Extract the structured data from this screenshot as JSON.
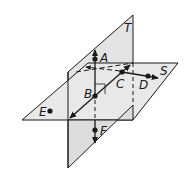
{
  "diagram": {
    "title": "",
    "planes": [
      {
        "name": "T",
        "label": "T",
        "orientation": "vertical"
      },
      {
        "name": "S",
        "label": "S",
        "orientation": "horizontal"
      }
    ],
    "points": [
      {
        "name": "A",
        "label": "A"
      },
      {
        "name": "B",
        "label": "B"
      },
      {
        "name": "C",
        "label": "C"
      },
      {
        "name": "D",
        "label": "D"
      },
      {
        "name": "E",
        "label": "E"
      },
      {
        "name": "F",
        "label": "F"
      }
    ],
    "colors": {
      "plane_fill": "#e6e6e6",
      "plane_fill_front": "#dcdcdc",
      "stroke": "#1a1a1a",
      "background": "#ffffff"
    }
  }
}
